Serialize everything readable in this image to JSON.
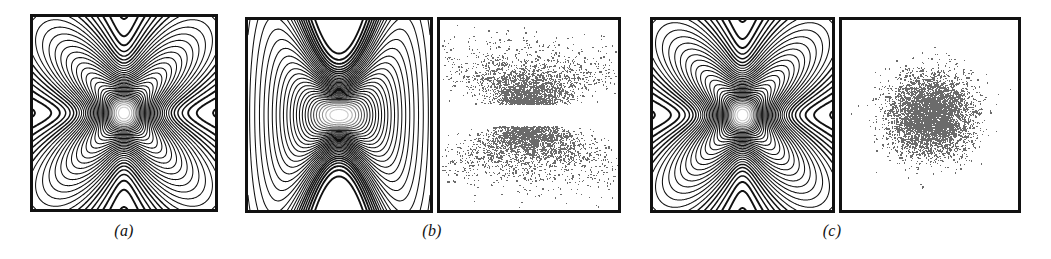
{
  "figure": {
    "type": "scientific-figure",
    "width": 1051,
    "height": 259,
    "background": "#ffffff",
    "ink_color": "#111111",
    "scatter_color": "#6b6b6b"
  },
  "captions": [
    {
      "id": "caption-a",
      "label": "(a)",
      "x": 124,
      "y": 222
    },
    {
      "id": "caption-b",
      "label": "(b)",
      "x": 432,
      "y": 222
    },
    {
      "id": "caption-c",
      "label": "(c)",
      "x": 832,
      "y": 222
    }
  ],
  "panels": [
    {
      "id": "panel-a-contour",
      "group": "a",
      "kind": "contour",
      "shape": "x-cross",
      "x": 30,
      "y": 14,
      "width": 188,
      "height": 198
    },
    {
      "id": "panel-b-contour",
      "group": "b",
      "kind": "contour",
      "shape": "hourglass",
      "x": 245,
      "y": 17,
      "width": 188,
      "height": 196
    },
    {
      "id": "panel-b-scatter",
      "group": "b",
      "kind": "scatter",
      "shape": "x-cross-cloud",
      "x": 437,
      "y": 17,
      "width": 184,
      "height": 196
    },
    {
      "id": "panel-c-contour",
      "group": "c",
      "kind": "contour",
      "shape": "x-cross",
      "x": 650,
      "y": 17,
      "width": 185,
      "height": 196
    },
    {
      "id": "panel-c-scatter",
      "group": "c",
      "kind": "scatter",
      "shape": "round-cloud",
      "x": 839,
      "y": 17,
      "width": 182,
      "height": 196
    }
  ],
  "chart_data": [
    {
      "id": "panel-a-contour",
      "type": "contour",
      "title": "",
      "xlabel": "",
      "ylabel": "",
      "xlim": [
        -3,
        3
      ],
      "ylim": [
        -3,
        3
      ],
      "grid": false,
      "legend": "none",
      "description": "Nested X / saltire shaped density contours, four lobes along the two diagonals, densest (darkest) near the centre of the cross, contour lines bunching up into a dark shading toward the core of each lobe.",
      "contour_levels": [
        0.02,
        0.05,
        0.09,
        0.14,
        0.2,
        0.27,
        0.35,
        0.44,
        0.54,
        0.65,
        0.77,
        0.9
      ],
      "arm_angles_deg": [
        45,
        135,
        225,
        315
      ],
      "arm_count": 4
    },
    {
      "id": "panel-b-contour",
      "type": "contour",
      "title": "",
      "xlabel": "",
      "ylabel": "",
      "xlim": [
        -3,
        3
      ],
      "ylim": [
        -3,
        3
      ],
      "grid": false,
      "legend": "none",
      "description": "Hourglass / bowtie shaped nested contours pinched at top and bottom centre, widest along the horizontal axis, bright saturated band across the middle.",
      "contour_levels": [
        0.02,
        0.05,
        0.09,
        0.14,
        0.2,
        0.27,
        0.35,
        0.44,
        0.54,
        0.65,
        0.77,
        0.9
      ],
      "pinch_axis": "vertical"
    },
    {
      "id": "panel-b-scatter",
      "type": "scatter",
      "title": "",
      "xlabel": "",
      "ylabel": "",
      "xlim": [
        -3,
        3
      ],
      "ylim": [
        -3,
        3
      ],
      "grid": false,
      "legend": "none",
      "marker_color": "#6b6b6b",
      "marker_size": 1.3,
      "n_points": 5000,
      "description": "Samples forming a four-pointed star / bowtie cloud, two dense horizontal wings above and below a thin gap through the middle, sparse outliers extending left and right."
    },
    {
      "id": "panel-c-contour",
      "type": "contour",
      "title": "",
      "xlabel": "",
      "ylabel": "",
      "xlim": [
        -3,
        3
      ],
      "ylim": [
        -3,
        3
      ],
      "grid": false,
      "legend": "none",
      "description": "Same nested X / saltire shaped density contours as panel (a), four diagonal lobes with dark banded shading.",
      "contour_levels": [
        0.02,
        0.05,
        0.09,
        0.14,
        0.2,
        0.27,
        0.35,
        0.44,
        0.54,
        0.65,
        0.77,
        0.9
      ],
      "arm_angles_deg": [
        45,
        135,
        225,
        315
      ],
      "arm_count": 4
    },
    {
      "id": "panel-c-scatter",
      "type": "scatter",
      "title": "",
      "xlabel": "",
      "ylabel": "",
      "xlim": [
        -3,
        3
      ],
      "ylim": [
        -3,
        3
      ],
      "grid": false,
      "legend": "none",
      "marker_color": "#6b6b6b",
      "marker_size": 1.3,
      "n_points": 5000,
      "description": "Samples forming a single isotropic round Gaussian blob centred in the panel, dense core fading radially outward with scattered outliers."
    }
  ]
}
